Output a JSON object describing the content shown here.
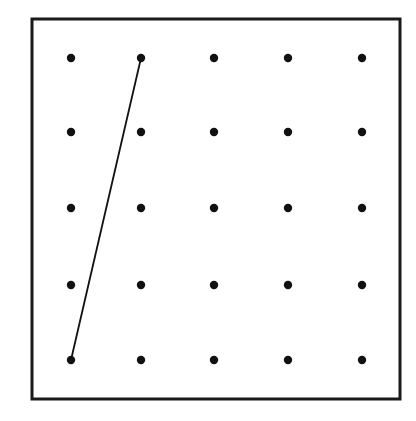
{
  "diagram": {
    "type": "geoboard dot grid",
    "grid": {
      "rows": 5,
      "cols": 5
    },
    "frame": {
      "x": 32,
      "y": 19,
      "width": 368,
      "height": 380,
      "stroke": "#1a1a1a"
    },
    "dot_color": "#111111",
    "columns_x": [
      71,
      141,
      214,
      288,
      362
    ],
    "rows_y": [
      58,
      132,
      208,
      285,
      360
    ],
    "segments": [
      {
        "from": {
          "row": 5,
          "col": 1
        },
        "to": {
          "row": 1,
          "col": 2
        }
      }
    ]
  }
}
